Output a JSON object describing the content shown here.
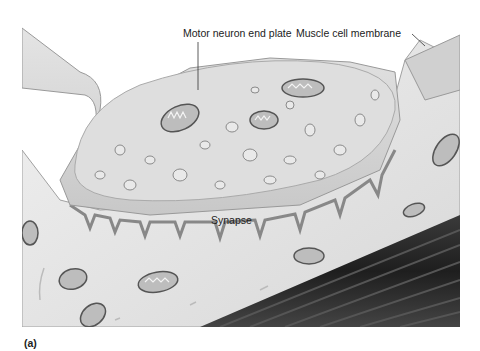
{
  "figure": {
    "panel_label": "(a)",
    "labels": {
      "motor_neuron_end_plate": "Motor neuron end plate",
      "muscle_cell_membrane": "Muscle cell membrane",
      "synapse": "Synapse"
    },
    "colors": {
      "background": "#ffffff",
      "cell_fill": "#e6e6e6",
      "neuron_fill": "#d4d4d4",
      "membrane_edge": "#9a9a9a",
      "myofibril_dark": "#2e2e2e",
      "text": "#222222"
    }
  }
}
